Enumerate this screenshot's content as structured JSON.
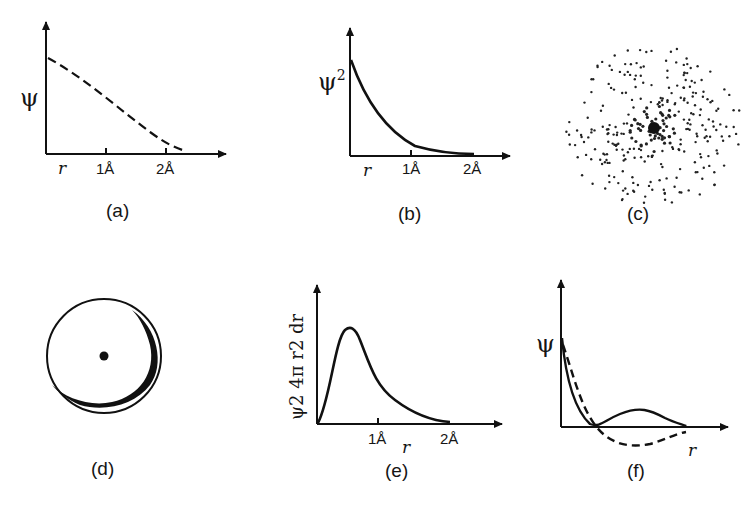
{
  "figure": {
    "panels": [
      {
        "id": "a",
        "label": "(a)",
        "ylabel": "ψ",
        "xlabel": "r",
        "ticks": [
          "1Å",
          "2Å"
        ],
        "curve_style": "dashed",
        "description": "wavefunction decreasing with r"
      },
      {
        "id": "b",
        "label": "(b)",
        "ylabel": "ψ",
        "ylabel_sup": "2",
        "xlabel": "r",
        "ticks": [
          "1Å",
          "2Å"
        ],
        "curve_style": "solid",
        "description": "probability density decaying exponentially"
      },
      {
        "id": "c",
        "label": "(c)",
        "description": "electron cloud dot-density representation"
      },
      {
        "id": "d",
        "label": "(d)",
        "description": "orbital boundary circle with nucleus dot"
      },
      {
        "id": "e",
        "label": "(e)",
        "ylabel": "ψ2 4π r2 dr",
        "xlabel": "r",
        "ticks": [
          "1Å",
          "2Å"
        ],
        "curve_style": "solid",
        "description": "radial probability distribution with peak"
      },
      {
        "id": "f",
        "label": "(f)",
        "ylabel": "ψ",
        "xlabel": "r",
        "curve_styles": [
          "solid",
          "dashed"
        ],
        "description": "two radial wavefunctions with node"
      }
    ]
  },
  "chart_data": [
    {
      "type": "line",
      "title": "(a)",
      "xlabel": "r",
      "ylabel": "ψ",
      "x_ticks": [
        "1Å",
        "2Å"
      ],
      "series": [
        {
          "name": "ψ",
          "style": "dashed",
          "x": [
            0,
            0.5,
            1.0,
            1.5,
            2.0,
            2.3
          ],
          "values": [
            1.0,
            0.78,
            0.55,
            0.3,
            0.1,
            0.03
          ]
        }
      ]
    },
    {
      "type": "line",
      "title": "(b)",
      "xlabel": "r",
      "ylabel": "ψ²",
      "x_ticks": [
        "1Å",
        "2Å"
      ],
      "series": [
        {
          "name": "ψ²",
          "style": "solid",
          "x": [
            0,
            0.25,
            0.5,
            1.0,
            1.5,
            2.0
          ],
          "values": [
            1.0,
            0.6,
            0.37,
            0.13,
            0.04,
            0.01
          ]
        }
      ]
    },
    {
      "type": "line",
      "title": "(e)",
      "xlabel": "r",
      "ylabel": "ψ² 4π r² dr",
      "x_ticks": [
        "1Å",
        "2Å"
      ],
      "series": [
        {
          "name": "radial probability",
          "style": "solid",
          "x": [
            0,
            0.25,
            0.5,
            0.75,
            1.0,
            1.5,
            2.0
          ],
          "values": [
            0,
            0.7,
            1.0,
            0.6,
            0.33,
            0.1,
            0.02
          ]
        }
      ]
    },
    {
      "type": "line",
      "title": "(f)",
      "xlabel": "r",
      "ylabel": "ψ",
      "series": [
        {
          "name": "solid",
          "style": "solid",
          "x": [
            0,
            0.2,
            0.5,
            0.8,
            1.2,
            1.7
          ],
          "values": [
            1.0,
            0.3,
            0.0,
            0.2,
            0.15,
            0.0
          ]
        },
        {
          "name": "dashed",
          "style": "dashed",
          "x": [
            0,
            0.2,
            0.5,
            0.8,
            1.2,
            1.7
          ],
          "values": [
            0.9,
            0.4,
            -0.1,
            -0.32,
            -0.25,
            -0.1
          ]
        }
      ]
    }
  ]
}
